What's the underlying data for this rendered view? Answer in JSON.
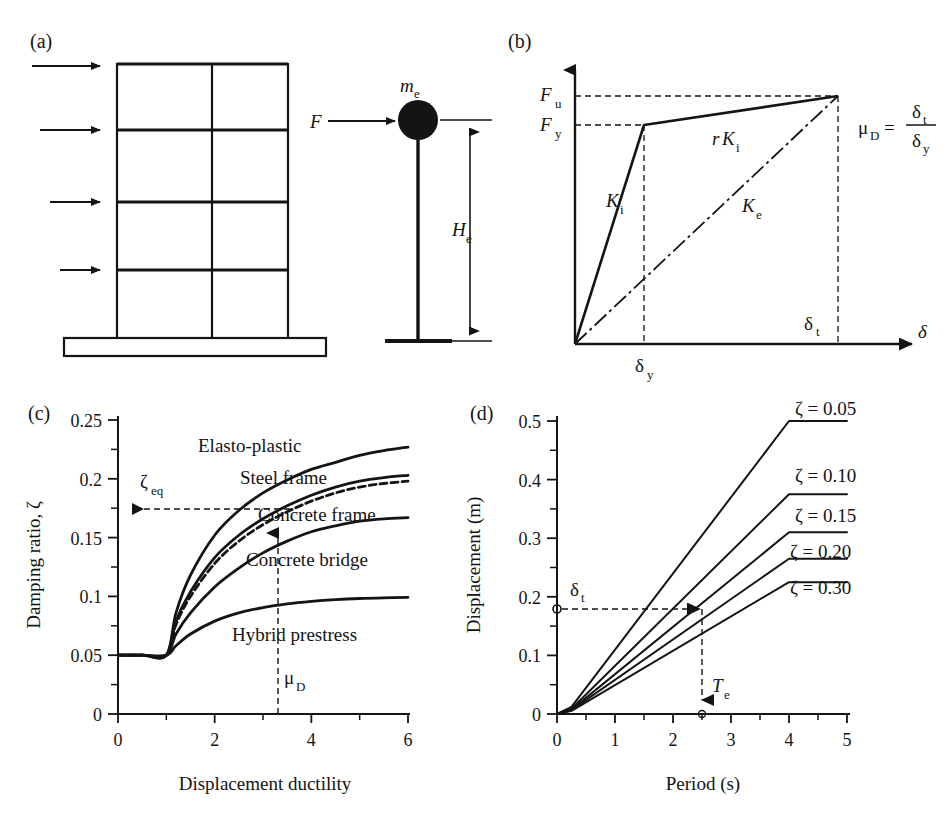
{
  "figure": {
    "background_color": "#ffffff",
    "line_color": "#141414"
  },
  "panels": {
    "a": {
      "label": "(a)",
      "description": "Multi-storey frame with lateral force arrows and equivalent SDOF substitute structure",
      "frame": {
        "stories": 4,
        "bays": 2,
        "arrow_count": 4
      },
      "sdof": {
        "force_label": "F",
        "mass_label": "m",
        "mass_subscript": "e",
        "height_label": "H",
        "height_subscript": "e"
      }
    },
    "b": {
      "label": "(b)",
      "description": "Bilinear force-displacement response with initial and effective stiffness",
      "axis": {
        "x_label": "δ",
        "y_levels": [
          {
            "label": "F",
            "subscript": "u",
            "value": 1.0
          },
          {
            "label": "F",
            "subscript": "y",
            "value": 0.88
          }
        ],
        "x_levels": [
          {
            "label": "δ",
            "subscript": "y",
            "value": 0.255
          },
          {
            "label": "δ",
            "subscript": "t",
            "value": 1.0
          }
        ]
      },
      "curve_labels": [
        {
          "text": "K",
          "subscript": "i",
          "prefix": ""
        },
        {
          "text": "K",
          "subscript": "i",
          "prefix": "r"
        },
        {
          "text": "K",
          "subscript": "e",
          "prefix": ""
        }
      ],
      "equation": {
        "lhs": "μ",
        "lhs_subscript": "D",
        "equals": "=",
        "numerator": "δ",
        "numerator_subscript": "t",
        "denominator": "δ",
        "denominator_subscript": "y"
      }
    },
    "c": {
      "label": "(c)",
      "annotation": {
        "zeta_eq_label": "ζ",
        "zeta_eq_subscript": "eq",
        "zeta_eq_value": 0.174,
        "mu_label": "μ",
        "mu_subscript": "D",
        "mu_value": 3.3
      }
    },
    "d": {
      "label": "(d)",
      "annotation": {
        "delta_label": "δ",
        "delta_subscript": "t",
        "delta_value": 0.18,
        "period_label": "T",
        "period_subscript": "e",
        "period_value": 2.5
      }
    }
  },
  "chart_data": [
    {
      "panel": "c",
      "type": "line",
      "title": "",
      "xlabel": "Displacement ductility",
      "ylabel": "Damping ratio, ζ",
      "xlim": [
        0,
        6
      ],
      "ylim": [
        0,
        0.25
      ],
      "xticks": [
        0,
        2,
        4,
        6
      ],
      "xticklabels": [
        "0",
        "2",
        "4",
        "6"
      ],
      "xminorticks": [
        1,
        3,
        5
      ],
      "yticks": [
        0,
        0.05,
        0.1,
        0.15,
        0.2,
        0.25
      ],
      "yticklabels": [
        "0",
        "0.05",
        "0.1",
        "0.15",
        "0.2",
        "0.25"
      ],
      "yminorticks": [
        0.025,
        0.075,
        0.125,
        0.175,
        0.225
      ],
      "grid": false,
      "legend": "inline-labels",
      "series": [
        {
          "name": "Elasto-plastic",
          "style": "solid",
          "label_position": "above-curve",
          "x": [
            0,
            0.5,
            1.0,
            1.2,
            1.5,
            2.0,
            2.5,
            3.0,
            3.5,
            4.0,
            4.5,
            5.0,
            5.5,
            6.0
          ],
          "values": [
            0.05,
            0.05,
            0.05,
            0.086,
            0.118,
            0.152,
            0.173,
            0.188,
            0.199,
            0.208,
            0.214,
            0.22,
            0.224,
            0.227
          ]
        },
        {
          "name": "Steel frame",
          "style": "solid",
          "label_position": "above-curve",
          "x": [
            0,
            0.5,
            1.0,
            1.2,
            1.5,
            2.0,
            2.5,
            3.0,
            3.5,
            4.0,
            4.5,
            5.0,
            5.5,
            6.0
          ],
          "values": [
            0.05,
            0.05,
            0.05,
            0.079,
            0.104,
            0.133,
            0.152,
            0.166,
            0.177,
            0.186,
            0.193,
            0.198,
            0.201,
            0.203
          ]
        },
        {
          "name": "Concrete frame",
          "style": "dashed",
          "label_position": "above-curve",
          "x": [
            0,
            0.5,
            1.0,
            1.2,
            1.5,
            2.0,
            2.5,
            3.0,
            3.5,
            4.0,
            4.5,
            5.0,
            5.5,
            6.0
          ],
          "values": [
            0.05,
            0.05,
            0.05,
            0.076,
            0.1,
            0.128,
            0.147,
            0.161,
            0.172,
            0.181,
            0.188,
            0.193,
            0.196,
            0.198
          ]
        },
        {
          "name": "Concrete bridge",
          "style": "solid",
          "label_position": "above-curve",
          "x": [
            0,
            0.5,
            1.0,
            1.2,
            1.5,
            2.0,
            2.5,
            3.0,
            3.5,
            4.0,
            4.5,
            5.0,
            5.5,
            6.0
          ],
          "values": [
            0.05,
            0.05,
            0.05,
            0.068,
            0.086,
            0.108,
            0.124,
            0.137,
            0.147,
            0.155,
            0.16,
            0.164,
            0.166,
            0.167
          ]
        },
        {
          "name": "Hybrid prestress",
          "style": "solid",
          "label_position": "below-curve",
          "x": [
            0,
            0.5,
            1.0,
            1.2,
            1.5,
            2.0,
            2.5,
            3.0,
            3.5,
            4.0,
            4.5,
            5.0,
            5.5,
            6.0
          ],
          "values": [
            0.05,
            0.05,
            0.05,
            0.058,
            0.068,
            0.079,
            0.086,
            0.0905,
            0.0936,
            0.0957,
            0.0972,
            0.0982,
            0.0988,
            0.0992
          ]
        }
      ]
    },
    {
      "panel": "d",
      "type": "line",
      "title": "",
      "xlabel": "Period (s)",
      "ylabel": "Displacement (m)",
      "xlim": [
        0,
        5
      ],
      "ylim": [
        0,
        0.5
      ],
      "xticks": [
        0,
        1,
        2,
        3,
        4,
        5
      ],
      "xticklabels": [
        "0",
        "1",
        "2",
        "3",
        "4",
        "5"
      ],
      "xminorticks": [
        0.5,
        1.5,
        2.5,
        3.5,
        4.5
      ],
      "yticks": [
        0,
        0.1,
        0.2,
        0.3,
        0.4,
        0.5
      ],
      "yticklabels": [
        "0",
        "0.1",
        "0.2",
        "0.3",
        "0.4",
        "0.5"
      ],
      "yminorticks": [
        0.05,
        0.15,
        0.25,
        0.35,
        0.45
      ],
      "grid": false,
      "legend": "inline-labels",
      "corner_period": 4.0,
      "series": [
        {
          "name": "ζ = 0.05",
          "style": "solid",
          "x": [
            0,
            0.25,
            4.0,
            5.0
          ],
          "values": [
            0,
            0.012,
            0.5,
            0.5
          ]
        },
        {
          "name": "ζ = 0.10",
          "style": "solid",
          "x": [
            0,
            0.25,
            4.0,
            5.0
          ],
          "values": [
            0,
            0.009,
            0.375,
            0.375
          ]
        },
        {
          "name": "ζ = 0.15",
          "style": "solid",
          "x": [
            0,
            0.25,
            4.0,
            5.0
          ],
          "values": [
            0,
            0.0075,
            0.31,
            0.31
          ]
        },
        {
          "name": "ζ = 0.20",
          "style": "solid",
          "x": [
            0,
            0.25,
            4.0,
            5.0
          ],
          "values": [
            0,
            0.0065,
            0.265,
            0.265
          ]
        },
        {
          "name": "ζ = 0.30",
          "style": "solid",
          "x": [
            0,
            0.25,
            4.0,
            5.0
          ],
          "values": [
            0,
            0.0055,
            0.225,
            0.225
          ]
        }
      ]
    }
  ]
}
